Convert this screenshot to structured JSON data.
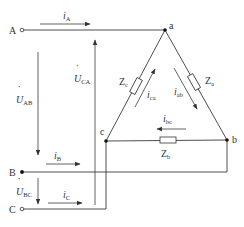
{
  "diagram": {
    "terminals": {
      "A": "A",
      "B": "B",
      "C": "C"
    },
    "nodes": {
      "a": "a",
      "b": "b",
      "c": "c"
    },
    "line_currents": {
      "iA": {
        "main": "i",
        "sub": "A"
      },
      "iB": {
        "main": "i",
        "sub": "B"
      },
      "iC": {
        "main": "i",
        "sub": "C"
      }
    },
    "phase_currents": {
      "iab": {
        "main": "i",
        "sub": "ab"
      },
      "ibc": {
        "main": "i",
        "sub": "bc"
      },
      "ica": {
        "main": "i",
        "sub": "ca"
      }
    },
    "voltages": {
      "UAB": {
        "main": "U",
        "sub": "AB",
        "dot": "˙"
      },
      "UBC": {
        "main": "U",
        "sub": "BC",
        "dot": "˙"
      },
      "UCA": {
        "main": "U",
        "sub": "CA",
        "dot": "˙"
      }
    },
    "impedances": {
      "Za": {
        "main": "Z",
        "sub": "a"
      },
      "Zb": {
        "main": "Z",
        "sub": "b"
      },
      "Zc": {
        "main": "Z",
        "sub": "c"
      }
    },
    "colors": {
      "wire": "#3a3a3a",
      "text": "#333333",
      "background": "#ffffff"
    }
  }
}
